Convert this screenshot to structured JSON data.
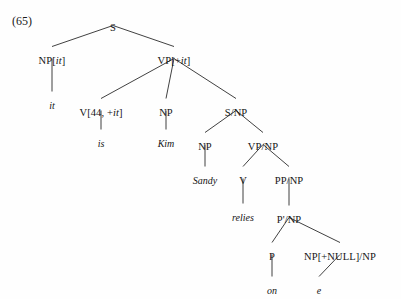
{
  "figure": {
    "example_number": "(65)",
    "type": "syntax-tree",
    "sentence": "it is Kim Sandy relies on e",
    "line_color": "#2b2b2b",
    "text_color": "#141414",
    "background": "#fefefe"
  },
  "nodes": [
    {
      "id": "S",
      "label": "S",
      "x": 113,
      "y": 22,
      "kind": "nonterminal"
    },
    {
      "id": "NPit",
      "label": "NP[it]",
      "x": 52,
      "y": 55,
      "kind": "nonterminal"
    },
    {
      "id": "VPplusit",
      "label": "VP[+it]",
      "x": 174,
      "y": 55,
      "kind": "nonterminal"
    },
    {
      "id": "it",
      "label": "it",
      "x": 52,
      "y": 100,
      "kind": "terminal"
    },
    {
      "id": "V44",
      "label": "V[44, +it]",
      "x": 101,
      "y": 107,
      "kind": "nonterminal"
    },
    {
      "id": "NPkim",
      "label": "NP",
      "x": 166,
      "y": 107,
      "kind": "nonterminal"
    },
    {
      "id": "SslashNP",
      "label": "S/NP",
      "x": 236,
      "y": 107,
      "kind": "nonterminal"
    },
    {
      "id": "is",
      "label": "is",
      "x": 101,
      "y": 138,
      "kind": "terminal"
    },
    {
      "id": "Kim",
      "label": "Kim",
      "x": 166,
      "y": 138,
      "kind": "terminal"
    },
    {
      "id": "NPsandy",
      "label": "NP",
      "x": 205,
      "y": 141,
      "kind": "nonterminal"
    },
    {
      "id": "VPslashNP",
      "label": "VP/NP",
      "x": 263,
      "y": 141,
      "kind": "nonterminal"
    },
    {
      "id": "Sandy",
      "label": "Sandy",
      "x": 205,
      "y": 175,
      "kind": "terminal"
    },
    {
      "id": "V",
      "label": "V",
      "x": 243,
      "y": 175,
      "kind": "nonterminal"
    },
    {
      "id": "PPslashNP",
      "label": "PP/NP",
      "x": 289,
      "y": 175,
      "kind": "nonterminal"
    },
    {
      "id": "relies",
      "label": "relies",
      "x": 243,
      "y": 212,
      "kind": "terminal"
    },
    {
      "id": "PbarSlashNP",
      "label": "P'/NP",
      "x": 289,
      "y": 214,
      "kind": "nonterminal"
    },
    {
      "id": "P",
      "label": "P",
      "x": 272,
      "y": 251,
      "kind": "nonterminal"
    },
    {
      "id": "NPnull",
      "label": "NP[+NULL]/NP",
      "x": 340,
      "y": 251,
      "kind": "nonterminal"
    },
    {
      "id": "on",
      "label": "on",
      "x": 272,
      "y": 285,
      "kind": "terminal"
    },
    {
      "id": "e",
      "label": "e",
      "x": 319,
      "y": 285,
      "kind": "terminal"
    }
  ],
  "edges": [
    {
      "from": "S",
      "to": "NPit"
    },
    {
      "from": "S",
      "to": "VPplusit"
    },
    {
      "from": "NPit",
      "to": "it"
    },
    {
      "from": "VPplusit",
      "to": "V44"
    },
    {
      "from": "VPplusit",
      "to": "NPkim"
    },
    {
      "from": "VPplusit",
      "to": "SslashNP"
    },
    {
      "from": "V44",
      "to": "is"
    },
    {
      "from": "NPkim",
      "to": "Kim"
    },
    {
      "from": "SslashNP",
      "to": "NPsandy"
    },
    {
      "from": "SslashNP",
      "to": "VPslashNP"
    },
    {
      "from": "NPsandy",
      "to": "Sandy"
    },
    {
      "from": "VPslashNP",
      "to": "V"
    },
    {
      "from": "VPslashNP",
      "to": "PPslashNP"
    },
    {
      "from": "V",
      "to": "relies"
    },
    {
      "from": "PPslashNP",
      "to": "PbarSlashNP"
    },
    {
      "from": "PbarSlashNP",
      "to": "P"
    },
    {
      "from": "PbarSlashNP",
      "to": "NPnull"
    },
    {
      "from": "P",
      "to": "on"
    },
    {
      "from": "NPnull",
      "to": "e"
    }
  ],
  "example_label_pos": {
    "x": 12,
    "y": 14
  }
}
